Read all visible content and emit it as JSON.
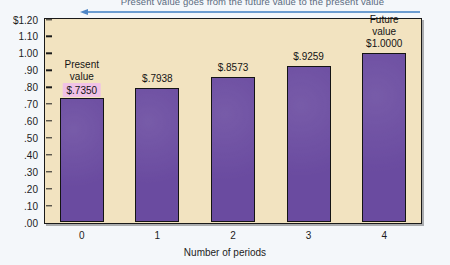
{
  "annotation": {
    "text": "Present value goes from the future value to the present value",
    "arrow_direction": "left",
    "arrow_color": "#4f86c6"
  },
  "colors": {
    "bar": "#6a4ba0",
    "plot_background": "#f2e3c0",
    "page_background": "#f4f7fa",
    "highlight": "#f0c2e6",
    "axis": "#1a1a1a"
  },
  "labels": {
    "present_value_line1": "Present",
    "present_value_line2": "value",
    "future_value_line1": "Future",
    "future_value_line2": "value"
  },
  "chart_data": {
    "type": "bar",
    "title": "",
    "xlabel": "Number of periods",
    "ylabel": "",
    "categories": [
      "0",
      "1",
      "2",
      "3",
      "4"
    ],
    "values": [
      0.735,
      0.7938,
      0.8573,
      0.9259,
      1.0
    ],
    "value_labels": [
      "$.7350",
      "$.7938",
      "$.8573",
      "$.9259",
      "$1.0000"
    ],
    "ylim": [
      0.0,
      1.2
    ],
    "ytick_values": [
      1.2,
      1.1,
      1.0,
      0.9,
      0.8,
      0.7,
      0.6,
      0.5,
      0.4,
      0.3,
      0.2,
      0.1,
      0.0
    ],
    "ytick_labels": [
      "$1.20",
      "1.10",
      "1.00",
      ".90",
      ".80",
      ".70",
      ".60",
      ".50",
      ".40",
      ".30",
      ".20",
      ".10",
      ".00"
    ],
    "grid": false,
    "legend": null,
    "annotations": [
      {
        "category": "0",
        "text": "Present value",
        "highlighted": true
      },
      {
        "category": "4",
        "text": "Future value",
        "highlighted": false
      }
    ]
  }
}
